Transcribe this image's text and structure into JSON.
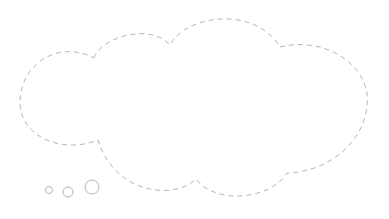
{
  "graphic": {
    "type": "thought-bubble",
    "stroke_color": "#b5b5b5",
    "fill_color": "#ffffff",
    "background": "#ffffff",
    "dash": "5 4",
    "trail_bubbles": [
      {
        "cx": 49,
        "cy": 190,
        "r": 3.5
      },
      {
        "cx": 68,
        "cy": 192,
        "r": 5
      },
      {
        "cx": 92,
        "cy": 187,
        "r": 7
      }
    ]
  }
}
